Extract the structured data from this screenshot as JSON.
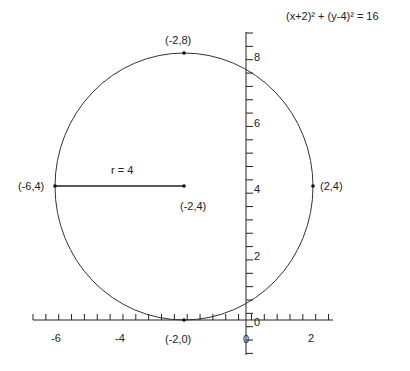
{
  "chart_data": {
    "type": "line",
    "title": "(x+2)² + (y-4)² = 16",
    "xlabel": "",
    "ylabel": "",
    "xlim": [
      -6.8,
      2.6
    ],
    "ylim": [
      -1,
      8.6
    ],
    "grid": false,
    "x_ticks": [
      -6,
      -4,
      0,
      2
    ],
    "y_ticks": [
      0,
      2,
      4,
      6,
      8
    ],
    "tick_labels": {
      "x": [
        "-6",
        "-4",
        "0",
        "2"
      ],
      "y": [
        "0",
        "2",
        "4",
        "6",
        "8"
      ]
    },
    "circle": {
      "center": [
        -2,
        4
      ],
      "radius": 4
    },
    "points": [
      {
        "x": -2,
        "y": 8,
        "label": "(-2,8)"
      },
      {
        "x": -6,
        "y": 4,
        "label": "(-6,4)"
      },
      {
        "x": -2,
        "y": 4,
        "label": "(-2,4)"
      },
      {
        "x": 2,
        "y": 4,
        "label": "(2,4)"
      },
      {
        "x": -2,
        "y": 0,
        "label": "(-2,0)"
      }
    ],
    "annotations": [
      {
        "text": "r = 4",
        "x": -4,
        "y": 4.5
      },
      {
        "text": "(x+2)² + (y-4)² = 16",
        "position": "top-right"
      }
    ]
  },
  "labels": {
    "equation": "(x+2)² + (y-4)² = 16",
    "radius": "r = 4",
    "top": "(-2,8)",
    "left": "(-6,4)",
    "center": "(-2,4)",
    "right": "(2,4)",
    "bottom": "(-2,0)",
    "xt_m6": "-6",
    "xt_m4": "-4",
    "xt_0": "0",
    "xt_2": "2",
    "yt_0": "0",
    "yt_2": "2",
    "yt_4": "4",
    "yt_6": "6",
    "yt_8": "8"
  }
}
